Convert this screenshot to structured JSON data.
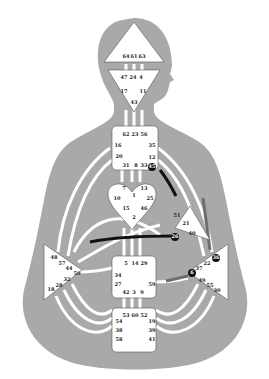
{
  "colors": {
    "background": "#ffffff",
    "body": "#a9a9a9",
    "center_fill": "#ffffff",
    "channel": "#ffffff",
    "active_channel": "#111111",
    "active_channel_gray": "#6e6e6e",
    "active_gate": "#111111",
    "text": "#222222"
  },
  "centers": {
    "head": {
      "name": "Head",
      "gates": [
        "64",
        "61",
        "63"
      ]
    },
    "ajna": {
      "name": "Ajna",
      "gates": [
        "47",
        "24",
        "4",
        "17",
        "11",
        "43"
      ]
    },
    "throat": {
      "name": "Throat",
      "gates": [
        "62",
        "23",
        "56",
        "16",
        "35",
        "20",
        "12",
        "31",
        "8",
        "33",
        "45"
      ]
    },
    "g": {
      "name": "G Center",
      "gates": [
        "7",
        "1",
        "13",
        "10",
        "25",
        "15",
        "46",
        "2"
      ]
    },
    "heart": {
      "name": "Heart/Ego",
      "gates": [
        "51",
        "21",
        "40",
        "26"
      ]
    },
    "spleen": {
      "name": "Spleen",
      "gates": [
        "48",
        "57",
        "44",
        "50",
        "32",
        "28",
        "18"
      ]
    },
    "sacral": {
      "name": "Sacral",
      "gates": [
        "5",
        "14",
        "29",
        "34",
        "27",
        "59",
        "42",
        "3",
        "9"
      ]
    },
    "solar_plexus": {
      "name": "Solar Plexus",
      "gates": [
        "36",
        "22",
        "37",
        "6",
        "49",
        "55",
        "30"
      ]
    },
    "root": {
      "name": "Root",
      "gates": [
        "53",
        "60",
        "52",
        "54",
        "19",
        "38",
        "39",
        "58",
        "41"
      ]
    }
  },
  "active_gates": [
    "45",
    "26",
    "6",
    "36"
  ],
  "active_channels": [
    {
      "from": "45",
      "to": "21",
      "style": "black"
    },
    {
      "from": "26",
      "to": "44",
      "style": "black"
    },
    {
      "from": "36",
      "to": "35",
      "style": "gray"
    },
    {
      "from": "6",
      "to": "59",
      "style": "gray"
    }
  ]
}
